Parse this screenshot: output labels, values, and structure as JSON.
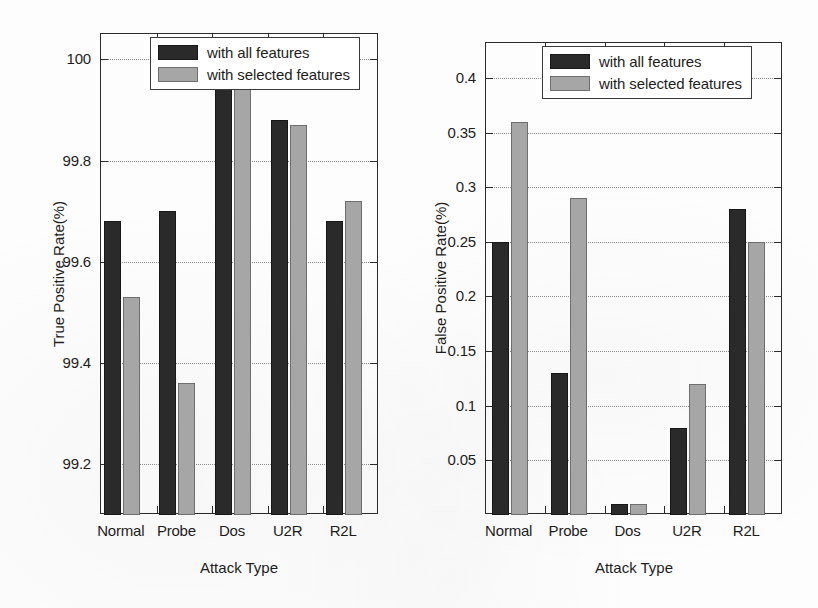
{
  "figure": {
    "width": 818,
    "height": 608,
    "background_color": "#fdfdfd"
  },
  "legend": {
    "entries": [
      {
        "label": "with all features",
        "color": "#2a2a2a",
        "swatch_name": "legend-swatch-all-features"
      },
      {
        "label": "with selected features",
        "color": "#a6a6a6",
        "swatch_name": "legend-swatch-selected-features"
      }
    ]
  },
  "chart_data": [
    {
      "id": "true-positive-rate",
      "type": "bar",
      "title": "",
      "xlabel": "Attack Type",
      "ylabel": "True Positive Rate(%)",
      "categories": [
        "Normal",
        "Probe",
        "Dos",
        "U2R",
        "R2L"
      ],
      "series": [
        {
          "name": "with all features",
          "color": "#2a2a2a",
          "values": [
            99.68,
            99.7,
            100.0,
            99.88,
            99.68
          ]
        },
        {
          "name": "with selected features",
          "color": "#a6a6a6",
          "values": [
            99.53,
            99.36,
            100.0,
            99.87,
            99.72
          ]
        }
      ],
      "ylim": [
        99.1,
        100.05
      ],
      "yticks": [
        99.2,
        99.4,
        99.6,
        99.8,
        100
      ],
      "ytick_labels": [
        "99.2",
        "99.4",
        "99.6",
        "99.8",
        "100"
      ],
      "grid": true,
      "legend_position": "top-center"
    },
    {
      "id": "false-positive-rate",
      "type": "bar",
      "title": "",
      "xlabel": "Attack Type",
      "ylabel": "False Positive Rate(%)",
      "categories": [
        "Normal",
        "Probe",
        "Dos",
        "U2R",
        "R2L"
      ],
      "series": [
        {
          "name": "with all features",
          "color": "#2a2a2a",
          "values": [
            0.25,
            0.13,
            0.01,
            0.08,
            0.28
          ]
        },
        {
          "name": "with selected features",
          "color": "#a6a6a6",
          "values": [
            0.36,
            0.29,
            0.01,
            0.12,
            0.25
          ]
        }
      ],
      "ylim": [
        0,
        0.432
      ],
      "yticks": [
        0.05,
        0.1,
        0.15,
        0.2,
        0.25,
        0.3,
        0.35,
        0.4
      ],
      "ytick_labels": [
        "0.05",
        "0.1",
        "0.15",
        "0.2",
        "0.25",
        "0.3",
        "0.35",
        "0.4"
      ],
      "grid": true,
      "legend_position": "top-center"
    }
  ]
}
